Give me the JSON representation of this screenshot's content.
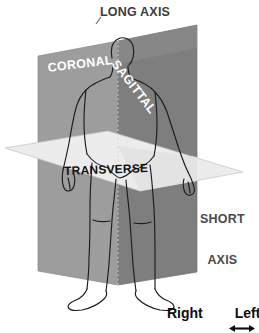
{
  "figure": {
    "background_color": "#ffffff",
    "width": 259,
    "height": 333
  },
  "axes": {
    "long_axis_label": "LONG AXIS",
    "short_axis_line1": "SHORT",
    "short_axis_line2": "AXIS",
    "label_color": "#3c3c3c"
  },
  "planes": [
    {
      "name": "coronal",
      "label": "CORONAL",
      "label_color": "#ffffff",
      "fill_color": "#9a9a9a",
      "orientation": "frontal vertical plane"
    },
    {
      "name": "sagittal",
      "label": "SAGITTAL",
      "label_color": "#ffffff",
      "fill_color": "#7f7f7f",
      "orientation": "median vertical plane"
    },
    {
      "name": "transverse",
      "label": "TRANSVERSE",
      "label_color": "#111111",
      "fill_color": "#ececec",
      "orientation": "horizontal cross-sectional plane"
    }
  ],
  "direction_indicator": {
    "left_term": "Right",
    "right_term": "Left",
    "arrow_glyph": "double-headed-horizontal-arrow",
    "text_color": "#0d0d0d"
  },
  "body_figure": {
    "name": "human-body-outline",
    "stroke_color": "#1a1a1a",
    "description": "standing human figure line drawing"
  }
}
